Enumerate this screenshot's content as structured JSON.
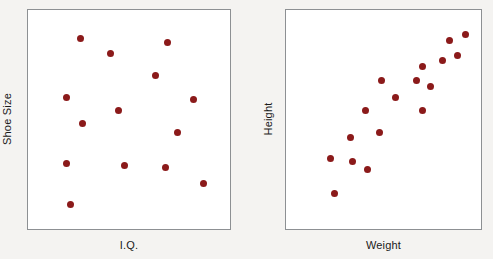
{
  "figure": {
    "background_color": "#f4f3f1",
    "point_color": "#8b1a1a",
    "frame_color": "#8d9093"
  },
  "chart_data": [
    {
      "type": "scatter",
      "title": "",
      "xlabel": "I.Q.",
      "ylabel": "Shoe Size",
      "xlim": [
        0,
        100
      ],
      "ylim": [
        0,
        100
      ],
      "grid": false,
      "legend": "none",
      "annotation": "No correlation between I.Q. and Shoe Size",
      "marker_color": "#8b1a1a",
      "points": [
        {
          "x": 26,
          "y": 87
        },
        {
          "x": 41,
          "y": 80
        },
        {
          "x": 69,
          "y": 85
        },
        {
          "x": 63,
          "y": 70
        },
        {
          "x": 19,
          "y": 60
        },
        {
          "x": 82,
          "y": 59
        },
        {
          "x": 45,
          "y": 54
        },
        {
          "x": 27,
          "y": 48
        },
        {
          "x": 74,
          "y": 44
        },
        {
          "x": 19,
          "y": 30
        },
        {
          "x": 48,
          "y": 29
        },
        {
          "x": 68,
          "y": 28
        },
        {
          "x": 87,
          "y": 21
        },
        {
          "x": 21,
          "y": 11
        }
      ]
    },
    {
      "type": "scatter",
      "title": "",
      "xlabel": "Weight",
      "ylabel": "Height",
      "xlim": [
        0,
        100
      ],
      "ylim": [
        0,
        100
      ],
      "grid": false,
      "legend": "none",
      "annotation": "Strong positive correlation between Weight and Height",
      "marker_color": "#8b1a1a",
      "points": [
        {
          "x": 92,
          "y": 89
        },
        {
          "x": 84,
          "y": 86
        },
        {
          "x": 88,
          "y": 79
        },
        {
          "x": 80,
          "y": 77
        },
        {
          "x": 70,
          "y": 74
        },
        {
          "x": 67,
          "y": 68
        },
        {
          "x": 49,
          "y": 68
        },
        {
          "x": 74,
          "y": 65
        },
        {
          "x": 56,
          "y": 60
        },
        {
          "x": 70,
          "y": 54
        },
        {
          "x": 41,
          "y": 54
        },
        {
          "x": 48,
          "y": 44
        },
        {
          "x": 33,
          "y": 42
        },
        {
          "x": 23,
          "y": 32
        },
        {
          "x": 34,
          "y": 31
        },
        {
          "x": 42,
          "y": 27
        },
        {
          "x": 25,
          "y": 16
        }
      ]
    }
  ]
}
